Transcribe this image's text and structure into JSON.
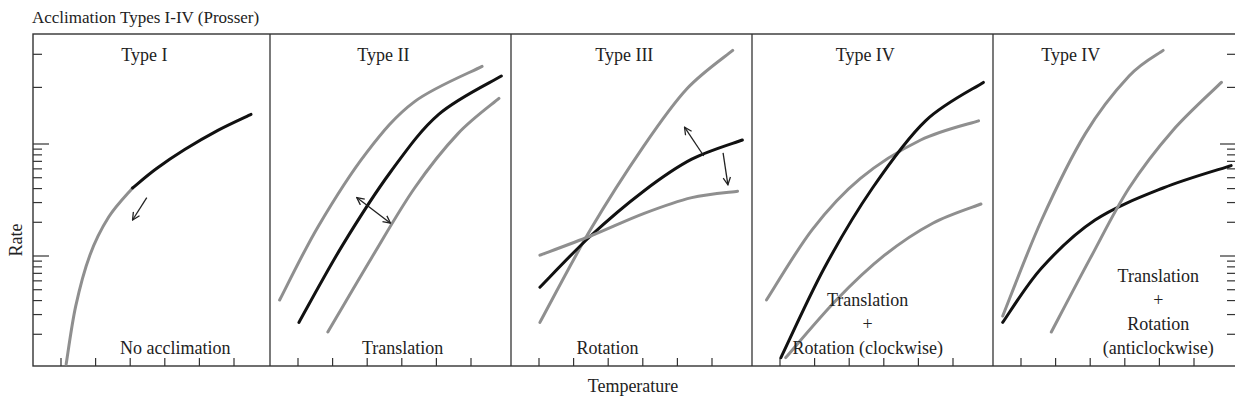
{
  "figure": {
    "title": "Acclimation Types I-IV (Prosser)",
    "xlabel": "Temperature",
    "ylabel": "Rate",
    "colors": {
      "acclimated_curve": "#111111",
      "reference_curve": "#8f8f8f",
      "axis": "#333333"
    }
  },
  "chart_data": {
    "type": "line",
    "title": "Acclimation Types I-IV (Prosser)",
    "xlabel": "Temperature",
    "ylabel": "Rate",
    "yscale": "log",
    "xlim": [
      0,
      1
    ],
    "ylim": [
      0,
      1
    ],
    "grid": false,
    "panels": [
      {
        "title": "Type I",
        "label_lines": [
          "No acclimation"
        ],
        "series": [
          {
            "name": "reference",
            "color": "grey",
            "points": [
              [
                0.14,
                0.0
              ],
              [
                0.18,
                0.18
              ],
              [
                0.24,
                0.34
              ],
              [
                0.32,
                0.46
              ],
              [
                0.42,
                0.55
              ]
            ]
          },
          {
            "name": "acclimated",
            "color": "black",
            "points": [
              [
                0.42,
                0.55
              ],
              [
                0.52,
                0.61
              ],
              [
                0.64,
                0.67
              ],
              [
                0.78,
                0.73
              ],
              [
                0.92,
                0.78
              ]
            ]
          }
        ],
        "arrows": [
          {
            "direction": "down-left",
            "from": [
              0.48,
              0.52
            ],
            "to": [
              0.42,
              0.45
            ]
          }
        ]
      },
      {
        "title": "Type II",
        "label_lines": [
          "Translation"
        ],
        "series": [
          {
            "name": "upper",
            "color": "grey",
            "points": [
              [
                0.04,
                0.2
              ],
              [
                0.2,
                0.43
              ],
              [
                0.4,
                0.66
              ],
              [
                0.6,
                0.82
              ],
              [
                0.88,
                0.93
              ]
            ]
          },
          {
            "name": "acclimated",
            "color": "black",
            "points": [
              [
                0.12,
                0.13
              ],
              [
                0.3,
                0.37
              ],
              [
                0.5,
                0.6
              ],
              [
                0.7,
                0.78
              ],
              [
                0.96,
                0.9
              ]
            ]
          },
          {
            "name": "lower",
            "color": "grey",
            "points": [
              [
                0.24,
                0.1
              ],
              [
                0.42,
                0.33
              ],
              [
                0.6,
                0.55
              ],
              [
                0.78,
                0.72
              ],
              [
                0.95,
                0.83
              ]
            ]
          }
        ],
        "arrows": [
          {
            "direction": "bidirectional",
            "from": [
              0.36,
              0.52
            ],
            "to": [
              0.5,
              0.44
            ]
          }
        ]
      },
      {
        "title": "Type III",
        "label_lines": [
          "Rotation"
        ],
        "series": [
          {
            "name": "steep",
            "color": "grey",
            "points": [
              [
                0.12,
                0.13
              ],
              [
                0.33,
                0.42
              ],
              [
                0.55,
                0.68
              ],
              [
                0.73,
                0.86
              ],
              [
                0.92,
                0.98
              ]
            ]
          },
          {
            "name": "acclimated",
            "color": "black",
            "points": [
              [
                0.12,
                0.24
              ],
              [
                0.33,
                0.4
              ],
              [
                0.55,
                0.54
              ],
              [
                0.75,
                0.64
              ],
              [
                0.96,
                0.7
              ]
            ]
          },
          {
            "name": "shallow",
            "color": "grey",
            "points": [
              [
                0.12,
                0.34
              ],
              [
                0.33,
                0.4
              ],
              [
                0.55,
                0.47
              ],
              [
                0.75,
                0.52
              ],
              [
                0.94,
                0.54
              ]
            ]
          }
        ],
        "arrows": [
          {
            "direction": "up-left",
            "from": [
              0.8,
              0.65
            ],
            "to": [
              0.72,
              0.74
            ]
          },
          {
            "direction": "down",
            "from": [
              0.88,
              0.66
            ],
            "to": [
              0.9,
              0.56
            ]
          }
        ]
      },
      {
        "title": "Type IV",
        "label_lines": [
          "Translation",
          "+",
          "Rotation (clockwise)"
        ],
        "series": [
          {
            "name": "upper",
            "color": "grey",
            "points": [
              [
                0.06,
                0.2
              ],
              [
                0.25,
                0.42
              ],
              [
                0.45,
                0.58
              ],
              [
                0.7,
                0.7
              ],
              [
                0.94,
                0.76
              ]
            ]
          },
          {
            "name": "acclimated",
            "color": "black",
            "points": [
              [
                0.12,
                0.02
              ],
              [
                0.3,
                0.3
              ],
              [
                0.5,
                0.55
              ],
              [
                0.72,
                0.76
              ],
              [
                0.96,
                0.88
              ]
            ]
          },
          {
            "name": "lower",
            "color": "grey",
            "points": [
              [
                0.14,
                0.02
              ],
              [
                0.35,
                0.2
              ],
              [
                0.55,
                0.34
              ],
              [
                0.75,
                0.44
              ],
              [
                0.95,
                0.5
              ]
            ]
          }
        ],
        "arrows": []
      },
      {
        "title": "Type IV",
        "label_lines": [
          "Translation",
          "+",
          "Rotation",
          "(anticlockwise)"
        ],
        "series": [
          {
            "name": "upper",
            "color": "grey",
            "points": [
              [
                0.04,
                0.15
              ],
              [
                0.2,
                0.45
              ],
              [
                0.38,
                0.72
              ],
              [
                0.56,
                0.9
              ],
              [
                0.7,
                0.98
              ]
            ]
          },
          {
            "name": "acclimated",
            "color": "black",
            "points": [
              [
                0.04,
                0.13
              ],
              [
                0.2,
                0.3
              ],
              [
                0.42,
                0.45
              ],
              [
                0.7,
                0.55
              ],
              [
                0.98,
                0.62
              ]
            ]
          },
          {
            "name": "lower",
            "color": "grey",
            "points": [
              [
                0.24,
                0.1
              ],
              [
                0.4,
                0.33
              ],
              [
                0.56,
                0.55
              ],
              [
                0.74,
                0.73
              ],
              [
                0.94,
                0.88
              ]
            ]
          }
        ],
        "arrows": []
      }
    ]
  }
}
